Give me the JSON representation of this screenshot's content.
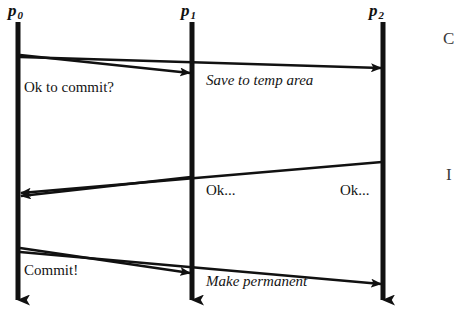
{
  "canvas": {
    "width": 462,
    "height": 316,
    "background": "#ffffff",
    "ink": "#111111"
  },
  "lifelines": [
    {
      "id": "p0",
      "name": "p",
      "subscript": "0",
      "x": 18,
      "label_x": 8,
      "label_y": 2,
      "top": 22,
      "bottom": 300
    },
    {
      "id": "p1",
      "name": "p",
      "subscript": "1",
      "x": 192,
      "label_x": 181,
      "label_y": 2,
      "top": 22,
      "bottom": 300
    },
    {
      "id": "p2",
      "name": "p",
      "subscript": "2",
      "x": 383,
      "label_x": 369,
      "label_y": 2,
      "top": 22,
      "bottom": 300
    }
  ],
  "messages": [
    {
      "id": "ok-to-commit",
      "label": "Ok to commit?",
      "style": "roman",
      "from": "p0",
      "to": "p1",
      "x1": 20,
      "y1": 55,
      "x2": 190,
      "y2": 73,
      "label_x": 24,
      "label_y": 80
    },
    {
      "id": "save-to-temp-area",
      "label": "Save to temp area",
      "style": "italic",
      "from": "p0",
      "to": "p2",
      "x1": 20,
      "y1": 57,
      "x2": 381,
      "y2": 68,
      "label_x": 206,
      "label_y": 73
    },
    {
      "id": "ok-from-p1",
      "label": "Ok...",
      "style": "roman",
      "from": "p1",
      "to": "p0",
      "x1": 191,
      "y1": 177,
      "x2": 21,
      "y2": 196,
      "label_x": 206,
      "label_y": 183
    },
    {
      "id": "ok-from-p2",
      "label": "Ok...",
      "style": "roman",
      "from": "p2",
      "to": "p0",
      "x1": 382,
      "y1": 162,
      "x2": 21,
      "y2": 193,
      "label_x": 340,
      "label_y": 183
    },
    {
      "id": "commit",
      "label": "Commit!",
      "style": "roman",
      "from": "p0",
      "to": "p1",
      "x1": 20,
      "y1": 248,
      "x2": 190,
      "y2": 273,
      "label_x": 24,
      "label_y": 263
    },
    {
      "id": "make-permanent",
      "label": "Make permanent",
      "style": "italic",
      "from": "p0",
      "to": "p2",
      "x1": 20,
      "y1": 252,
      "x2": 381,
      "y2": 284,
      "label_x": 206,
      "label_y": 274
    }
  ],
  "edge_fragments": [
    {
      "id": "fragment-top-right",
      "text": "C",
      "x": 443,
      "y": 30
    },
    {
      "id": "fragment-mid-right",
      "text": "I",
      "x": 446,
      "y": 166
    }
  ]
}
